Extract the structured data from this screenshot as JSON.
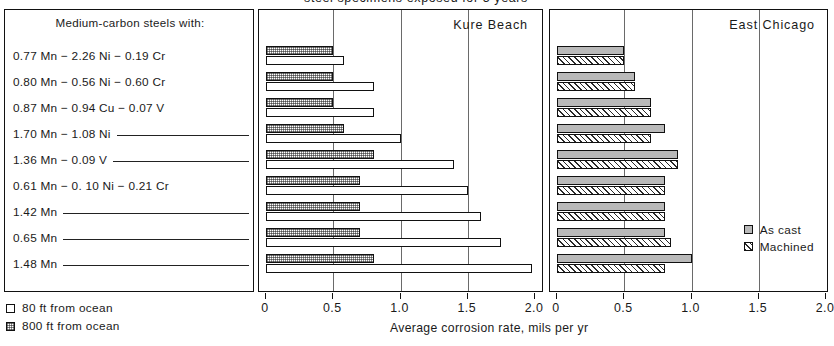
{
  "title": "steel specimens exposed for 5 years",
  "left_box": {
    "heading": "Medium-carbon steels with:",
    "rows": [
      {
        "text": "0.77 Mn − 2.26 Ni − 0.19 Cr",
        "rule": false
      },
      {
        "text": "0.80 Mn − 0.56 Ni − 0.60 Cr",
        "rule": false
      },
      {
        "text": "0.87 Mn − 0.94 Cu − 0.07 V",
        "rule": false
      },
      {
        "text": "1.70 Mn −  1.08 Ni",
        "rule": true
      },
      {
        "text": "1.36 Mn − 0.09 V",
        "rule": true
      },
      {
        "text": "0.61 Mn − 0. 10 Ni − 0.21 Cr",
        "rule": false
      },
      {
        "text": "1.42 Mn",
        "rule": true
      },
      {
        "text": "0.65 Mn",
        "rule": true
      },
      {
        "text": "1.48 Mn",
        "rule": true
      }
    ]
  },
  "bottom_legend": {
    "items": [
      {
        "label": "80 ft from ocean",
        "swatch": "white-square-icon"
      },
      {
        "label": "800 ft from ocean",
        "swatch": "dotted-square-icon"
      }
    ]
  },
  "east_chicago_legend": {
    "items": [
      {
        "label": "As cast",
        "swatch": "gray-square-icon"
      },
      {
        "label": "Machined",
        "swatch": "hatched-square-icon"
      }
    ]
  },
  "axis": {
    "caption": "Average corrosion rate, mils per yr",
    "ticks": [
      "0",
      "0.5",
      "1.0",
      "1.5",
      "2.0"
    ],
    "tick_values": [
      0,
      0.5,
      1.0,
      1.5,
      2.0
    ],
    "range": [
      0,
      2.0
    ]
  },
  "chart_data": {
    "type": "bar",
    "orientation": "horizontal",
    "title": "steel specimens exposed for 5 years",
    "xlabel": "Average corrosion rate, mils per yr",
    "ylabel": "",
    "xlim": [
      0,
      2.0
    ],
    "xticks": [
      0,
      0.5,
      1.0,
      1.5,
      2.0
    ],
    "grid": true,
    "categories": [
      "0.77 Mn − 2.26 Ni − 0.19 Cr",
      "0.80 Mn − 0.56 Ni − 0.60 Cr",
      "0.87 Mn − 0.94 Cu − 0.07 V",
      "1.70 Mn − 1.08 Ni",
      "1.36 Mn − 0.09 V",
      "0.61 Mn − 0.10 Ni − 0.21 Cr",
      "1.42 Mn",
      "0.65 Mn",
      "1.48 Mn"
    ],
    "panels": [
      {
        "name": "Kure Beach",
        "legend_position": "bottom-left-outside",
        "series": [
          {
            "name": "800 ft from ocean",
            "fill": "dotted",
            "values": [
              0.5,
              0.5,
              0.5,
              0.58,
              0.8,
              0.7,
              0.7,
              0.7,
              0.8
            ]
          },
          {
            "name": "80 ft from ocean",
            "fill": "white",
            "values": [
              0.58,
              0.8,
              0.8,
              1.0,
              1.4,
              1.5,
              1.6,
              1.75,
              1.98
            ]
          }
        ]
      },
      {
        "name": "East Chicago",
        "legend_position": "inside-bottom-right",
        "series": [
          {
            "name": "As cast",
            "fill": "gray",
            "values": [
              0.5,
              0.58,
              0.7,
              0.8,
              0.9,
              0.8,
              0.8,
              0.8,
              1.0
            ]
          },
          {
            "name": "Machined",
            "fill": "hatched",
            "values": [
              0.5,
              0.58,
              0.7,
              0.7,
              0.9,
              0.8,
              0.8,
              0.85,
              0.8
            ]
          }
        ]
      }
    ]
  }
}
